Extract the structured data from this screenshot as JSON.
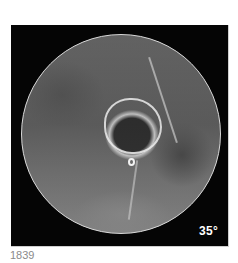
{
  "figure": {
    "angle_label": "35°",
    "caption_number": "1839",
    "colors": {
      "background": "#ffffff",
      "frame": "#050505",
      "label": "#ffffff",
      "caption": "#8a8a8a"
    }
  }
}
